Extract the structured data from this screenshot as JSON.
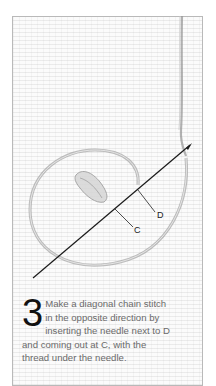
{
  "figure": {
    "labels": {
      "d": "D",
      "c": "C"
    },
    "colors": {
      "frame": "#b9b9b9",
      "fabric": "#fbfbfb",
      "needle": "#1a1a1a",
      "thread": "#8a8a8a",
      "step_number": "#111111",
      "body_text": "#6a6a6a"
    }
  },
  "step": {
    "number": "3",
    "lines": [
      "Make a diagonal chain stitch",
      "in the opposite direction by",
      "inserting the needle next to D",
      "and coming out at C, with the",
      "thread under the needle."
    ]
  }
}
